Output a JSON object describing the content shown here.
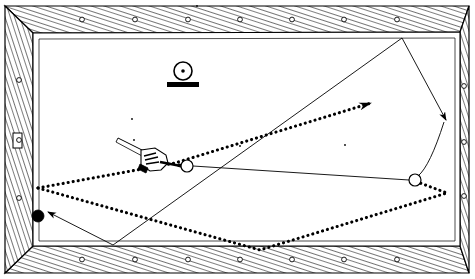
{
  "diagram": {
    "canvas": {
      "width": 475,
      "height": 279
    },
    "colors": {
      "ink": "#000000",
      "cloth": "#ffffff",
      "rail_wood": "#ffffff",
      "rail_hatch": "#000000",
      "ball_solid": "#000000",
      "ball_hollow_fill": "#ffffff"
    },
    "table": {
      "outer_frame": {
        "x": 5,
        "y": 6,
        "width": 464,
        "height": 268
      },
      "rail_band_thickness": 26,
      "cloth_area": {
        "x": 33,
        "y": 34,
        "width": 408,
        "height": 212
      },
      "sight_marker_radius": 2.4,
      "sight_markers": {
        "top_count": 7,
        "bottom_count": 7,
        "left_count": 3,
        "right_count": 3,
        "top_x": [
          82,
          135,
          188,
          240,
          292,
          344,
          397
        ],
        "bottom_x": [
          82,
          135,
          188,
          240,
          292,
          344,
          397
        ],
        "left_y": [
          80,
          140,
          198
        ],
        "right_y": [
          86,
          142,
          196
        ]
      },
      "left_rail_plate": {
        "x": 13,
        "y": 133,
        "width": 9,
        "height": 15
      }
    },
    "balls": [
      {
        "id": "cue-ball",
        "label": "cue ball",
        "type": "hollow",
        "cx": 187,
        "cy": 166,
        "r": 6
      },
      {
        "id": "object-ball-right",
        "label": "object ball at right rail",
        "type": "hollow",
        "cx": 415,
        "cy": 180,
        "r": 6
      },
      {
        "id": "target-ball-black",
        "label": "target ball",
        "type": "solid",
        "cx": 38,
        "cy": 216,
        "r": 6
      }
    ],
    "spot_marker": {
      "label": "ball on spot marker",
      "circle": {
        "cx": 183,
        "cy": 71,
        "r": 9
      },
      "center_dot_r": 1.8,
      "base": {
        "x": 167,
        "y": 82,
        "width": 32,
        "height": 5
      }
    },
    "cue": {
      "label": "cue stick with bridge hand",
      "stick_from": {
        "x": 120,
        "y": 140
      },
      "stick_to": {
        "x": 181,
        "y": 166
      },
      "hand_center": {
        "x": 153,
        "y": 158
      }
    },
    "paths": {
      "dotted_primary": {
        "label": "dotted cue-ball path with arrowhead",
        "style": "dotted",
        "points": [
          {
            "x": 38,
            "y": 188
          },
          {
            "x": 175,
            "y": 163
          },
          {
            "x": 371,
            "y": 103
          }
        ],
        "arrow_at": "end"
      },
      "dotted_bank": {
        "label": "dotted three-cushion bank path",
        "style": "dotted",
        "points": [
          {
            "x": 38,
            "y": 188
          },
          {
            "x": 260,
            "y": 250
          },
          {
            "x": 447,
            "y": 193
          },
          {
            "x": 420,
            "y": 183
          }
        ],
        "arrow_at": "none"
      },
      "solid_aim": {
        "label": "solid aiming line from cue ball to right rail ball",
        "style": "solid",
        "points": [
          {
            "x": 193,
            "y": 166
          },
          {
            "x": 409,
            "y": 180
          }
        ]
      },
      "solid_diagonal": {
        "label": "solid long diagonal line to top right corner",
        "style": "solid",
        "points": [
          {
            "x": 113,
            "y": 245
          },
          {
            "x": 402,
            "y": 38
          }
        ]
      },
      "solid_return": {
        "label": "solid return line to right rail with arrowhead",
        "style": "solid",
        "points": [
          {
            "x": 402,
            "y": 38
          },
          {
            "x": 446,
            "y": 120
          }
        ],
        "arrow_at": "end"
      },
      "solid_curve": {
        "label": "solid curved line from right rail down to object ball",
        "style": "curve",
        "from": {
          "x": 444,
          "y": 122
        },
        "control": {
          "x": 430,
          "y": 166
        },
        "to": {
          "x": 418,
          "y": 176
        }
      },
      "solid_to_black": {
        "label": "solid arrow pointing at black target ball",
        "style": "solid",
        "points": [
          {
            "x": 113,
            "y": 245
          },
          {
            "x": 48,
            "y": 212
          }
        ],
        "arrow_at": "end"
      }
    },
    "stray_dots": [
      {
        "x": 132,
        "y": 119
      },
      {
        "x": 134,
        "y": 140
      },
      {
        "x": 240,
        "y": 146
      },
      {
        "x": 345,
        "y": 145
      },
      {
        "x": 197,
        "y": 6
      }
    ]
  }
}
